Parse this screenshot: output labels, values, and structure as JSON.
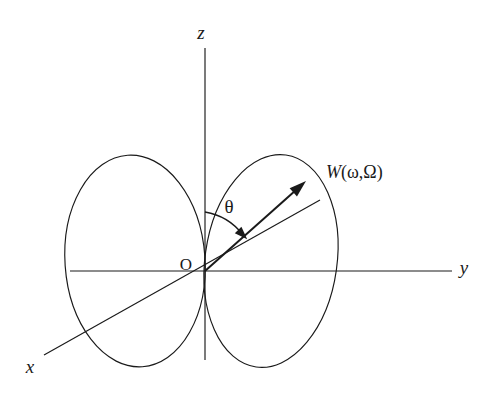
{
  "figure": {
    "kind": "3d-coordinate-dipole-lobe-diagram",
    "background_color": "#ffffff",
    "line_color": "#1a1a1a",
    "width": 493,
    "height": 406
  },
  "axes": [
    {
      "id": "z",
      "label": "z",
      "name": "z-axis",
      "orientation": "vertical",
      "has_arrowhead": false,
      "label_x": 201,
      "label_y": 35,
      "x1": 205,
      "y1": 48,
      "x2": 205,
      "y2": 360
    },
    {
      "id": "y",
      "label": "y",
      "name": "y-axis",
      "orientation": "horizontal-right",
      "has_arrowhead": false,
      "label_x": 464,
      "label_y": 270,
      "x1": 70,
      "y1": 271,
      "x2": 452,
      "y2": 271
    },
    {
      "id": "x",
      "label": "x",
      "name": "x-axis",
      "orientation": "oblique-lower-left",
      "has_arrowhead": false,
      "label_x": 30,
      "label_y": 369,
      "x1": 320,
      "y1": 200,
      "x2": 44,
      "y2": 355
    }
  ],
  "origin": {
    "label": "O",
    "name": "origin-marker",
    "x": 205,
    "y": 271,
    "label_x": 186,
    "label_y": 266
  },
  "vector": {
    "label_parts": {
      "symbol": "W",
      "open_paren": "(",
      "arg1": "ω",
      "comma": ",",
      "arg2": "Ω",
      "close_paren": ")"
    },
    "label_full": "W(ω,Ω)",
    "name": "radiation-vector",
    "start_x": 205,
    "start_y": 271,
    "tip_x": 306,
    "tip_y": 181,
    "label_x": 326,
    "label_y": 174,
    "has_arrowhead": true
  },
  "angle": {
    "symbol": "θ",
    "name": "polar-angle-theta",
    "label_x": 229,
    "label_y": 209,
    "arc_start_x": 205,
    "arc_start_y": 212,
    "arc_end_x": 243,
    "arc_end_y": 235,
    "arc_radius": 60,
    "measured_from": "z-axis",
    "measured_to": "radiation-vector",
    "has_arrowhead": true
  },
  "lobes": [
    {
      "id": "lobe-left",
      "name": "dipole-lobe-left",
      "center_x": 135,
      "center_y": 261,
      "radius_x": 70,
      "radius_y": 106,
      "rotation_deg": -4
    },
    {
      "id": "lobe-right",
      "name": "dipole-lobe-right",
      "center_x": 271,
      "center_y": 261,
      "radius_x": 66,
      "radius_y": 107,
      "rotation_deg": 8
    }
  ]
}
